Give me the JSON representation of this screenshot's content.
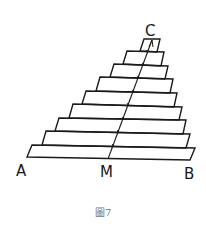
{
  "figure": {
    "caption": "圖7",
    "labels": {
      "A": "A",
      "M": "M",
      "B": "B",
      "C": "C"
    },
    "colors": {
      "line": "#1a1a1a",
      "caption": "#777777",
      "background": "#ffffff"
    }
  }
}
